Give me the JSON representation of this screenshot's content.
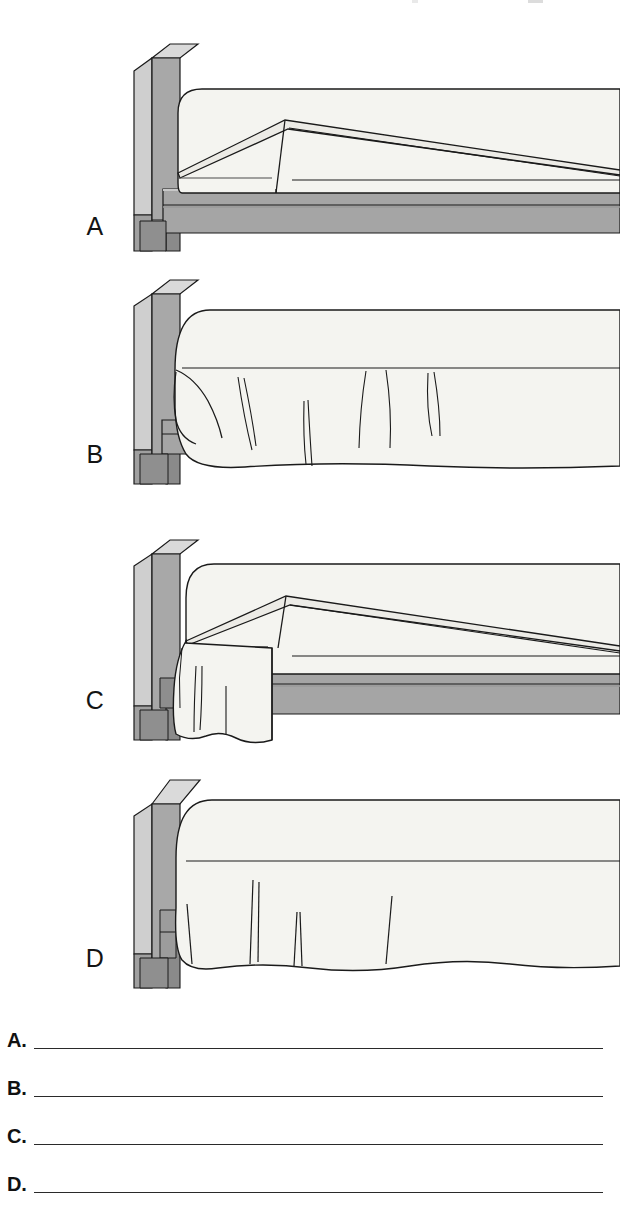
{
  "document": {
    "type": "worksheet",
    "title": "Bed Making Identification Worksheet",
    "background_color": "#ffffff"
  },
  "figure": {
    "caption": "Four line drawings of a bed viewed from the side, each showing a different stage or style of bed making.",
    "panels": [
      {
        "letter": "A",
        "name": "panel-a",
        "description": "Bed with flat mattress and folded top sheet turned back; bare platform base visible along the side."
      },
      {
        "letter": "B",
        "name": "panel-b",
        "description": "Bed fully covered by a bedspread that hangs down over the base with soft vertical folds; hem falls in a wavy line."
      },
      {
        "letter": "C",
        "name": "panel-c",
        "description": "Bed with the top sheet and blanket draped over the near corner by the headboard, base rails exposed."
      },
      {
        "letter": "D",
        "name": "panel-d",
        "description": "Bed completely covered by a bedspread reaching nearly to the floor with pleat folds along the bottom edge."
      }
    ]
  },
  "colors": {
    "line": "#1a1a1a",
    "linen": "#f4f4f0",
    "linen_shade": "#eceae4",
    "wood_face": "#a8a8a8",
    "wood_edge": "#cfcfcf",
    "wood_top": "#dadada",
    "wood_dark": "#8e8e8e",
    "base_gray": "#a5a5a5",
    "base_gray_dark": "#949494",
    "shadow": "#6f6f6f",
    "rule": "#2a2a2a"
  },
  "answers": {
    "instruction_lines": [
      {
        "label": "A.",
        "value": "",
        "placeholder": ""
      },
      {
        "label": "B.",
        "value": "",
        "placeholder": ""
      },
      {
        "label": "C.",
        "value": "",
        "placeholder": ""
      },
      {
        "label": "D.",
        "value": "",
        "placeholder": ""
      }
    ]
  }
}
